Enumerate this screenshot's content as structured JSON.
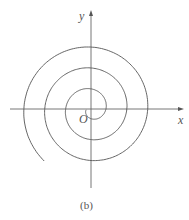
{
  "figure": {
    "caption": "(b)",
    "axis_x_label": "x",
    "axis_y_label": "y",
    "origin_label": "O",
    "stroke_color": "#555555"
  },
  "chart_data": {
    "type": "line",
    "title": "",
    "subtitle": "Archimedean spiral",
    "xlabel": "x",
    "ylabel": "y",
    "grid": false,
    "legend": "none",
    "curve": "r = a*theta",
    "origin_px": [
      91,
      109
    ],
    "axis_crossings_px": {
      "top": [
        71,
        42
      ],
      "right": [
        124,
        151
      ],
      "bottom": [
        141,
        163
      ],
      "left": [
        45
      ]
    }
  }
}
